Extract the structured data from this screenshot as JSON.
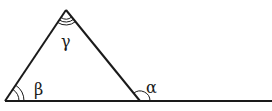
{
  "diagram": {
    "type": "triangle-exterior-angle",
    "stroke_color": "#1a1a1a",
    "background": "#ffffff",
    "vertices": {
      "apex": {
        "x": 66,
        "y": 10
      },
      "base_left": {
        "x": 5,
        "y": 101
      },
      "base_right": {
        "x": 140,
        "y": 101
      }
    },
    "baseline_extension_end": {
      "x": 272,
      "y": 101
    },
    "angles": [
      {
        "name": "gamma",
        "symbol": "γ",
        "vertex": "apex",
        "arc_count": 3
      },
      {
        "name": "beta",
        "symbol": "β",
        "vertex": "base_left",
        "arc_count": 2
      },
      {
        "name": "alpha",
        "symbol": "α",
        "vertex": "base_right",
        "arc_count": 1,
        "exterior": true
      }
    ]
  },
  "labels": {
    "gamma": "γ",
    "beta": "β",
    "alpha": "α"
  }
}
